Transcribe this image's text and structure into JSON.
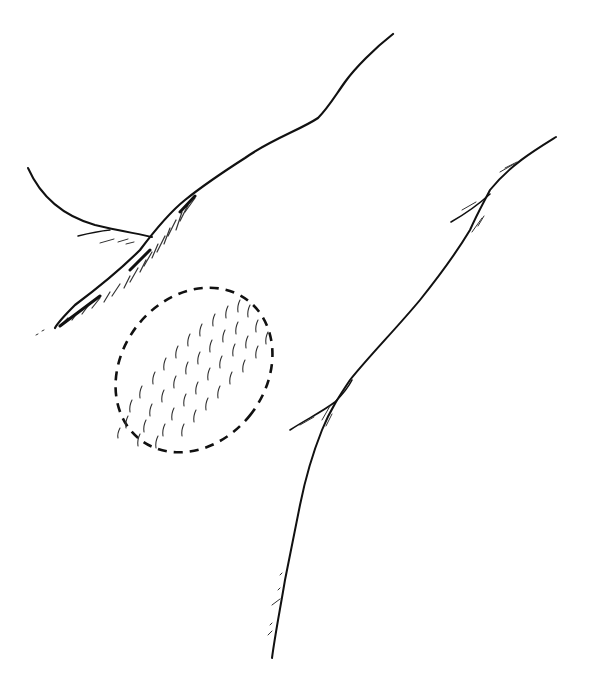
{
  "figure": {
    "type": "anatomical line drawing",
    "background": "#ffffff",
    "ink_color": "#111111",
    "hatch_color": "#333333",
    "regions": [
      {
        "name": "upper-body-contour",
        "description": "long curved line from upper right descending to left with hairy hatching near lower end"
      },
      {
        "name": "left-fold-curve",
        "description": "curved contour from upper left meeting main contour"
      },
      {
        "name": "right-limb-contour",
        "description": "long line from upper right down to bottom center with branching folds"
      },
      {
        "name": "marked-area",
        "description": "dashed ellipse filled with short hair-like strokes",
        "border": "dashed"
      }
    ]
  }
}
